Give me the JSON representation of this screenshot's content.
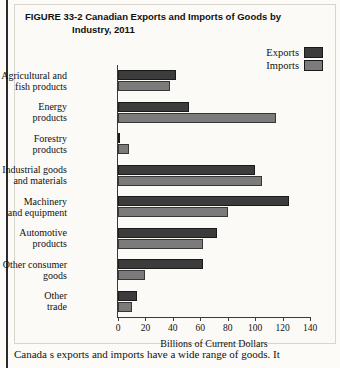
{
  "figure": {
    "number": "FIGURE 33-2",
    "title_line1": "Canadian Exports and Imports of Goods by",
    "title_line2": "Industry, 2011"
  },
  "legend": {
    "items": [
      {
        "label": "Exports",
        "color": "#3c3c3c"
      },
      {
        "label": "Imports",
        "color": "#7b7b7b"
      }
    ]
  },
  "caption": "Canada s exports and imports have a wide range of goods. It",
  "chart_data": {
    "type": "bar",
    "orientation": "horizontal",
    "title": "Canadian Exports and Imports of Goods by Industry, 2011",
    "xlabel": "Billions of Current Dollars",
    "ylabel": "",
    "xlim": [
      0,
      140
    ],
    "xticks": [
      0,
      20,
      40,
      60,
      80,
      100,
      120,
      140
    ],
    "grid": false,
    "legend_position": "top-right",
    "categories": [
      "Agricultural and fish products",
      "Energy products",
      "Forestry products",
      "Industrial goods and materials",
      "Machinery and equipment",
      "Automotive products",
      "Other consumer goods",
      "Other trade"
    ],
    "category_lines": [
      [
        "Agricultural and",
        "fish products"
      ],
      [
        "Energy",
        "products"
      ],
      [
        "Forestry",
        "products"
      ],
      [
        "Industrial goods",
        "and materials"
      ],
      [
        "Machinery",
        "and equipment"
      ],
      [
        "Automotive",
        "products"
      ],
      [
        "Other consumer",
        "goods"
      ],
      [
        "Other",
        "trade"
      ]
    ],
    "series": [
      {
        "name": "Exports",
        "color": "#3c3c3c",
        "values": [
          42,
          52,
          1,
          100,
          125,
          72,
          62,
          14
        ]
      },
      {
        "name": "Imports",
        "color": "#7b7b7b",
        "values": [
          38,
          115,
          8,
          105,
          80,
          62,
          20,
          10
        ]
      }
    ]
  }
}
